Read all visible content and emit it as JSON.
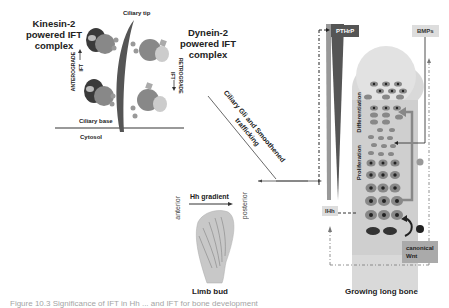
{
  "ift": {
    "kinesin_title": "Kinesin-2 powered IFT complex",
    "dynein_title": "Dynein-2 powered IFT complex",
    "ciliary_tip": "Ciliary tip",
    "ciliary_base": "Ciliary base",
    "cytosol": "Cytosol",
    "anterograde": "ANTEROGRADE",
    "anterograde_ift": "IFT",
    "retrograde": "RETROGRADE",
    "retrograde_ift": "IFT"
  },
  "trafficking": {
    "line1": "Ciliary Gli and Smoothened",
    "line2": "trafficking"
  },
  "limb": {
    "hh_gradient": "Hh gradient",
    "anterior": "anterior",
    "posterior": "posterior",
    "title": "Limb bud"
  },
  "bone": {
    "pthrp": "PTHrP",
    "bmps": "BMPs",
    "ihh": "IHh",
    "differentiation": "Differentiation",
    "proliferation": "Proliferation",
    "canonical_wnt": "canonical Wnt",
    "title": "Growing long bone"
  },
  "colors": {
    "dark_gray": "#555555",
    "mid_gray": "#888888",
    "light_gray": "#dddddd",
    "bone_bg": "#d8d8d8"
  },
  "caption": "Figure 10.3  Significance of IFT in Hh ... and IFT for bone development"
}
